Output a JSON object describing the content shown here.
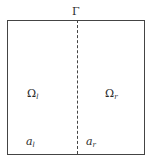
{
  "diagram": {
    "interface_label": "Γ",
    "left_region": {
      "symbol": "Ω",
      "subscript": "l"
    },
    "right_region": {
      "symbol": "Ω",
      "subscript": "r"
    },
    "left_coef": {
      "symbol": "a",
      "subscript": "l"
    },
    "right_coef": {
      "symbol": "a",
      "subscript": "r"
    }
  }
}
